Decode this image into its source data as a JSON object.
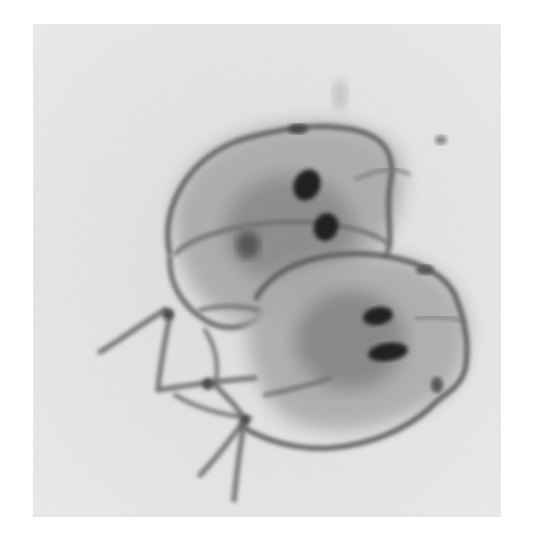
{
  "image": {
    "subject": "Micrograph of two pear-shaped flagellated protozoa (trophozoites) with paired dark nuclei",
    "style": "grayscale",
    "colors": {
      "page_background": "#ffffff",
      "field_background": "#e6e6e6",
      "cell_body": "#9a9a9a",
      "cell_outline": "#5a5a5a",
      "flagella": "#6e6e6e",
      "nuclei": "#1a1a1a"
    },
    "objects": [
      {
        "name": "upper-organism",
        "nuclei_count": 2
      },
      {
        "name": "lower-organism",
        "nuclei_count": 2
      }
    ]
  }
}
